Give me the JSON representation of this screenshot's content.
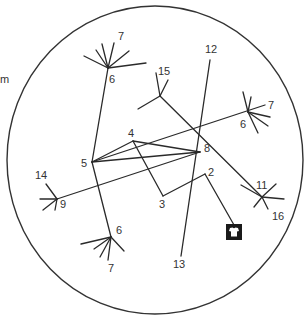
{
  "diagram": {
    "type": "node-link circle diagram",
    "colors": {
      "line": "#2a2a2a",
      "text": "#333333",
      "background": "#ffffff",
      "icon": "#1a1a1a"
    },
    "boundary": {
      "cx": 155,
      "cy": 160,
      "rx": 148,
      "ry": 154
    },
    "side_label": "m",
    "labels": [
      {
        "id": "l7a",
        "text": "7",
        "x": 118,
        "y": 40
      },
      {
        "id": "l6a",
        "text": "6",
        "x": 109,
        "y": 83
      },
      {
        "id": "l12",
        "text": "12",
        "x": 205,
        "y": 53
      },
      {
        "id": "l15",
        "text": "15",
        "x": 158,
        "y": 75
      },
      {
        "id": "l7b",
        "text": "7",
        "x": 268,
        "y": 109
      },
      {
        "id": "l6b",
        "text": "6",
        "x": 240,
        "y": 128
      },
      {
        "id": "l4",
        "text": "4",
        "x": 128,
        "y": 137
      },
      {
        "id": "l8",
        "text": "8",
        "x": 204,
        "y": 152
      },
      {
        "id": "l5",
        "text": "5",
        "x": 81,
        "y": 167
      },
      {
        "id": "l2",
        "text": "2",
        "x": 208,
        "y": 176
      },
      {
        "id": "l14",
        "text": "14",
        "x": 35,
        "y": 179
      },
      {
        "id": "l9",
        "text": "9",
        "x": 60,
        "y": 208
      },
      {
        "id": "l3",
        "text": "3",
        "x": 159,
        "y": 208
      },
      {
        "id": "l11",
        "text": "11",
        "x": 256,
        "y": 189
      },
      {
        "id": "l16",
        "text": "16",
        "x": 272,
        "y": 220
      },
      {
        "id": "l6c",
        "text": "6",
        "x": 116,
        "y": 234
      },
      {
        "id": "l7c",
        "text": "7",
        "x": 108,
        "y": 272
      },
      {
        "id": "l13",
        "text": "13",
        "x": 173,
        "y": 268
      }
    ],
    "edges": [
      [
        108,
        68,
        92,
        162
      ],
      [
        108,
        68,
        84,
        56
      ],
      [
        108,
        68,
        96,
        50
      ],
      [
        108,
        68,
        102,
        44
      ],
      [
        108,
        68,
        114,
        43
      ],
      [
        108,
        68,
        129,
        51
      ],
      [
        108,
        68,
        146,
        63
      ],
      [
        92,
        162,
        133,
        141
      ],
      [
        133,
        141,
        200,
        152
      ],
      [
        92,
        162,
        200,
        152
      ],
      [
        92,
        162,
        265,
        105
      ],
      [
        133,
        141,
        163,
        196
      ],
      [
        163,
        196,
        205,
        174
      ],
      [
        205,
        174,
        234,
        225
      ],
      [
        210,
        60,
        181,
        256
      ],
      [
        160,
        96,
        262,
        197
      ],
      [
        160,
        96,
        156,
        73
      ],
      [
        160,
        96,
        168,
        80
      ],
      [
        160,
        96,
        138,
        109
      ],
      [
        57,
        199,
        200,
        152
      ],
      [
        57,
        199,
        46,
        184
      ],
      [
        57,
        199,
        40,
        199
      ],
      [
        57,
        199,
        43,
        210
      ],
      [
        57,
        199,
        55,
        210
      ],
      [
        248,
        112,
        243,
        92
      ],
      [
        248,
        112,
        251,
        97
      ],
      [
        248,
        112,
        270,
        117
      ],
      [
        248,
        112,
        268,
        126
      ],
      [
        248,
        112,
        258,
        133
      ],
      [
        262,
        197,
        276,
        184
      ],
      [
        262,
        197,
        284,
        199
      ],
      [
        262,
        197,
        254,
        207
      ],
      [
        262,
        197,
        268,
        209
      ],
      [
        262,
        197,
        241,
        185
      ],
      [
        92,
        162,
        111,
        237
      ],
      [
        111,
        237,
        81,
        244
      ],
      [
        111,
        237,
        94,
        249
      ],
      [
        111,
        237,
        100,
        257
      ],
      [
        111,
        237,
        108,
        260
      ],
      [
        111,
        237,
        124,
        251
      ]
    ],
    "icon": {
      "name": "shirt-icon",
      "x": 226,
      "y": 224,
      "size": 16
    }
  }
}
